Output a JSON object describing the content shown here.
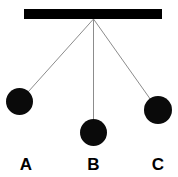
{
  "figure": {
    "background_color": "#ffffff",
    "width": 178,
    "height": 177
  },
  "support": {
    "name": "horizontal support bar",
    "color": "#000000",
    "x": 24,
    "y": 9,
    "width": 138,
    "height": 10
  },
  "pivot": {
    "x": 93.5,
    "y": 19
  },
  "string_color": "#8c8c8c",
  "bob_color": "#0a0a0a",
  "label_color": "#000000",
  "pendulums": [
    {
      "label": "A",
      "bob_cx": 19.5,
      "bob_cy": 101.5,
      "bob_r": 13.5,
      "label_x": 26,
      "label_y": 170,
      "string_length": 106.7,
      "angle_from_vertical_deg": 44
    },
    {
      "label": "B",
      "bob_cx": 93.5,
      "bob_cy": 132.5,
      "bob_r": 13.5,
      "label_x": 93.5,
      "label_y": 170,
      "string_length": 113.5,
      "angle_from_vertical_deg": 0
    },
    {
      "label": "C",
      "bob_cx": 158,
      "bob_cy": 110,
      "bob_r": 14,
      "label_x": 158,
      "label_y": 170,
      "string_length": 111.6,
      "angle_from_vertical_deg": 35
    }
  ]
}
